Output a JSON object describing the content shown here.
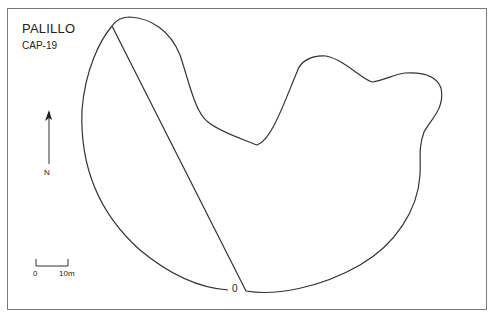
{
  "map": {
    "title": "PALILLO",
    "subtitle": "CAP-19",
    "north_label": "N",
    "scale": {
      "start_label": "0",
      "end_label": "10m"
    },
    "contour_label": "0",
    "colors": {
      "line": "#333333",
      "frame": "#7a7a7a",
      "background": "#ffffff"
    }
  }
}
